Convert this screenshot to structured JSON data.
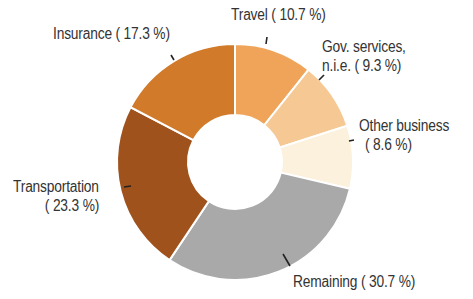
{
  "chart_data": {
    "type": "pie",
    "variant": "donut",
    "title": "",
    "start_angle_deg": 0,
    "direction": "clockwise",
    "slices": [
      {
        "label": "Travel",
        "value": 10.7,
        "color": "#F0A45A",
        "display": "Travel ( 10.7 %)"
      },
      {
        "label": "Gov. services, n.i.e.",
        "value": 9.3,
        "color": "#F6C894",
        "display_lines": [
          "Gov. services,",
          "n.i.e. (  9.3 %)"
        ]
      },
      {
        "label": "Other business",
        "value": 8.6,
        "color": "#FBF1DC",
        "display_lines": [
          "Other business",
          "(  8.6 %)"
        ]
      },
      {
        "label": "Remaining",
        "value": 30.7,
        "color": "#A9A9A9",
        "display": "Remaining ( 30.7 %)"
      },
      {
        "label": "Transportation",
        "value": 23.3,
        "color": "#A0521C",
        "display_lines": [
          "Transportation",
          "( 23.3 %)"
        ]
      },
      {
        "label": "Insurance",
        "value": 17.3,
        "color": "#D07A2A",
        "display": "Insurance ( 17.3 %)"
      }
    ],
    "units": "%",
    "legend": "none (direct labels)"
  },
  "labels": {
    "travel": "Travel ( 10.7 %)",
    "gov_line1": "Gov. services,",
    "gov_line2": "n.i.e. (  9.3 %)",
    "other_line1": "Other business",
    "other_line2": "(  8.6 %)",
    "remaining": "Remaining ( 30.7 %)",
    "transport_line1": "Transportation",
    "transport_line2": "( 23.3 %)",
    "insurance": "Insurance ( 17.3 %)"
  }
}
